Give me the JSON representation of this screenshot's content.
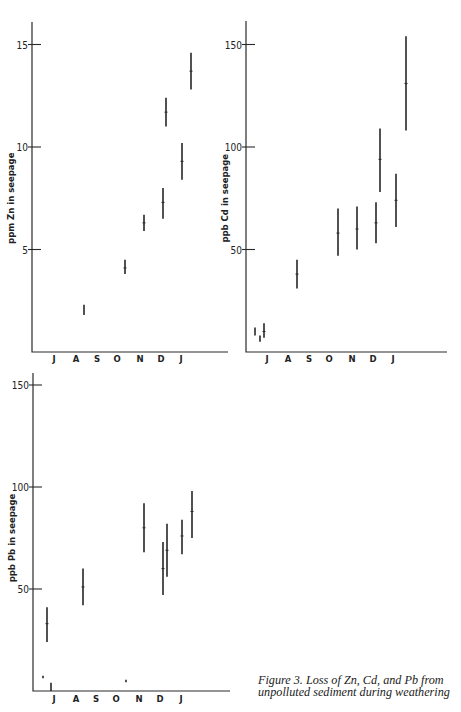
{
  "caption": {
    "line1": "Figure 3.   Loss of Zn, Cd, and Pb from",
    "line2": "unpolluted sediment during weathering"
  },
  "chart_data": [
    {
      "type": "range-bar",
      "id": "zn",
      "title": "",
      "ylabel": "ppm Zn in seepage",
      "xlabel": "",
      "ylim": [
        0,
        16.5
      ],
      "yticks": [
        5,
        10,
        15
      ],
      "ytick_labels": [
        "5",
        "10",
        "15"
      ],
      "months": [
        "J",
        "A",
        "S",
        "O",
        "N",
        "D",
        "J"
      ],
      "grid": false,
      "frame": {
        "x0": 32,
        "xEnd": 228,
        "yZero": 352,
        "yTop": 22,
        "pxPerUnit": 20.5,
        "monthX": [
          54,
          76,
          97,
          117,
          140,
          161,
          181
        ],
        "monthY": 362
      },
      "ranges": [
        {
          "x": 84,
          "month": "A",
          "low": 1.8,
          "high": 2.3,
          "mid": 2.05
        },
        {
          "x": 125,
          "month": "O",
          "low": 3.8,
          "high": 4.5,
          "mid": 4.1
        },
        {
          "x": 144,
          "month": "N",
          "low": 5.9,
          "high": 6.7,
          "mid": 6.3
        },
        {
          "x": 163,
          "month": "D",
          "low": 6.5,
          "high": 8.0,
          "mid": 7.3
        },
        {
          "x": 166,
          "month": "D",
          "low": 11.0,
          "high": 12.4,
          "mid": 11.7
        },
        {
          "x": 182,
          "month": "J",
          "low": 8.4,
          "high": 10.2,
          "mid": 9.3
        },
        {
          "x": 191,
          "month": "J",
          "low": 12.8,
          "high": 14.6,
          "mid": 13.7
        }
      ]
    },
    {
      "type": "range-bar",
      "id": "cd",
      "title": "",
      "ylabel": "ppb Cd in seepage",
      "xlabel": "",
      "ylim": [
        0,
        161
      ],
      "yticks": [
        50,
        100,
        150
      ],
      "ytick_labels": [
        "50",
        "100",
        "150"
      ],
      "months": [
        "J",
        "A",
        "S",
        "O",
        "N",
        "D",
        "J"
      ],
      "grid": false,
      "frame": {
        "x0": 246,
        "xEnd": 447,
        "yZero": 352,
        "yTop": 21,
        "pxPerUnit": 2.05,
        "monthX": [
          267,
          288,
          309,
          329,
          352,
          373,
          393
        ],
        "monthY": 362
      },
      "ranges": [
        {
          "x": 255,
          "month": "J",
          "low": 8,
          "high": 12,
          "mid": 10
        },
        {
          "x": 260,
          "month": "J",
          "low": 5,
          "high": 8,
          "mid": 6.5
        },
        {
          "x": 264,
          "month": "J",
          "low": 7,
          "high": 14,
          "mid": 10
        },
        {
          "x": 297,
          "month": "A",
          "low": 31,
          "high": 45,
          "mid": 38
        },
        {
          "x": 338,
          "month": "O",
          "low": 47,
          "high": 70,
          "mid": 58
        },
        {
          "x": 357,
          "month": "N",
          "low": 50,
          "high": 71,
          "mid": 60
        },
        {
          "x": 376,
          "month": "D",
          "low": 53,
          "high": 73,
          "mid": 63
        },
        {
          "x": 380,
          "month": "D",
          "low": 78,
          "high": 109,
          "mid": 94
        },
        {
          "x": 396,
          "month": "J",
          "low": 61,
          "high": 87,
          "mid": 74
        },
        {
          "x": 406,
          "month": "J",
          "low": 108,
          "high": 154,
          "mid": 131
        }
      ]
    },
    {
      "type": "range-bar",
      "id": "pb",
      "title": "",
      "ylabel": "ppb Pb in seepage",
      "xlabel": "",
      "ylim": [
        0,
        156
      ],
      "yticks": [
        50,
        100,
        150
      ],
      "ytick_labels": [
        "50",
        "100",
        "150"
      ],
      "months": [
        "J",
        "A",
        "S",
        "O",
        "N",
        "D",
        "J"
      ],
      "grid": false,
      "frame": {
        "x0": 33,
        "xEnd": 230,
        "yZero": 691,
        "yTop": 373,
        "pxPerUnit": 2.04,
        "monthX": [
          54,
          76,
          96,
          116,
          139,
          160,
          181
        ],
        "monthY": 702
      },
      "ranges": [
        {
          "x": 43,
          "month": "J",
          "low": 6.5,
          "high": 7.5,
          "mid": 7
        },
        {
          "x": 51,
          "month": "J",
          "low": 0,
          "high": 4,
          "mid": 2
        },
        {
          "x": 47,
          "month": "J",
          "low": 24,
          "high": 41,
          "mid": 33
        },
        {
          "x": 83,
          "month": "A",
          "low": 42,
          "high": 60,
          "mid": 51
        },
        {
          "x": 126,
          "month": "O",
          "low": 4.5,
          "high": 5.5,
          "mid": 5
        },
        {
          "x": 144,
          "month": "N",
          "low": 68,
          "high": 92,
          "mid": 80
        },
        {
          "x": 163,
          "month": "D",
          "low": 47,
          "high": 73,
          "mid": 60
        },
        {
          "x": 167,
          "month": "D",
          "low": 56,
          "high": 82,
          "mid": 69
        },
        {
          "x": 182,
          "month": "J",
          "low": 67,
          "high": 84,
          "mid": 76
        },
        {
          "x": 192,
          "month": "J",
          "low": 75,
          "high": 98,
          "mid": 88
        }
      ]
    }
  ]
}
